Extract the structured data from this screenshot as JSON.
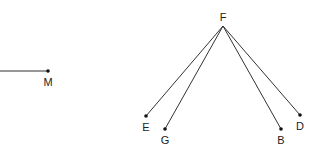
{
  "diagram": {
    "colors": {
      "line": "#333333",
      "point": "#111111",
      "label": "#222222",
      "background": "#ffffff"
    },
    "segment_m": {
      "label": "M",
      "x1": 0,
      "y1": 71,
      "x2": 48,
      "y2": 71
    },
    "apex": {
      "label": "F",
      "x": 223,
      "y": 26
    },
    "rays": [
      {
        "label": "E",
        "x": 146,
        "y": 116
      },
      {
        "label": "G",
        "x": 165,
        "y": 129
      },
      {
        "label": "B",
        "x": 281,
        "y": 129
      },
      {
        "label": "D",
        "x": 300,
        "y": 115
      }
    ]
  }
}
